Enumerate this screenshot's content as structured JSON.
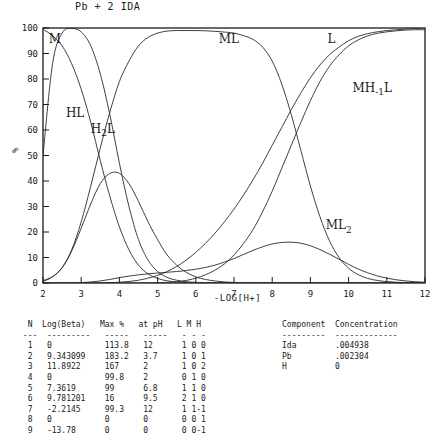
{
  "title": "Pb + 2 IDA",
  "chart_data": {
    "type": "line",
    "title": "Pb + 2 IDA",
    "xlabel": "-LOG[H+]",
    "ylabel": "%",
    "xlim": [
      2,
      12
    ],
    "ylim": [
      0,
      100
    ],
    "xticks": [
      2,
      3,
      4,
      5,
      6,
      7,
      8,
      9,
      10,
      11,
      12
    ],
    "yticks": [
      0,
      10,
      20,
      30,
      40,
      50,
      60,
      70,
      80,
      90,
      100
    ],
    "grid": false,
    "legend": "inline-curve-labels",
    "x": [
      2,
      2.25,
      2.5,
      2.75,
      3,
      3.25,
      3.5,
      3.75,
      4,
      4.25,
      4.5,
      4.75,
      5,
      5.25,
      5.5,
      5.75,
      6,
      6.25,
      6.5,
      6.75,
      7,
      7.25,
      7.5,
      7.75,
      8,
      8.25,
      8.5,
      8.75,
      9,
      9.25,
      9.5,
      9.75,
      10,
      10.25,
      10.5,
      10.75,
      11,
      11.25,
      11.5,
      11.75,
      12
    ],
    "series": [
      {
        "name": "M",
        "label": "M",
        "values": [
          50,
          86,
          98,
          99.8,
          98.5,
          93,
          82,
          66,
          47,
          30,
          17,
          9,
          4.5,
          2.2,
          1.1,
          0.5,
          0.25,
          0.12,
          0.06,
          0.03,
          0.01,
          0,
          0,
          0,
          0,
          0,
          0,
          0,
          0,
          0,
          0,
          0,
          0,
          0,
          0,
          0,
          0,
          0,
          0,
          0,
          0
        ]
      },
      {
        "name": "H2L",
        "label": "H2L",
        "values": [
          99.5,
          97,
          93,
          86,
          76,
          63,
          48,
          34,
          22,
          13,
          7,
          3.6,
          1.8,
          0.85,
          0.4,
          0.18,
          0.08,
          0.035,
          0.015,
          0.006,
          0.002,
          0,
          0,
          0,
          0,
          0,
          0,
          0,
          0,
          0,
          0,
          0,
          0,
          0,
          0,
          0,
          0,
          0,
          0,
          0,
          0
        ]
      },
      {
        "name": "HL",
        "label": "HL",
        "values": [
          0.6,
          2.4,
          6,
          12.5,
          21.5,
          31,
          39,
          43,
          43,
          39,
          32,
          24,
          17,
          11,
          7,
          4.2,
          2.4,
          1.4,
          0.8,
          0.42,
          0.22,
          0.11,
          0.06,
          0.03,
          0.015,
          0.007,
          0.003,
          0.001,
          0,
          0,
          0,
          0,
          0,
          0,
          0,
          0,
          0,
          0,
          0,
          0,
          0
        ]
      },
      {
        "name": "ML",
        "label": "ML",
        "values": [
          0.9,
          2.5,
          6,
          13,
          24,
          38,
          53,
          67,
          79,
          87,
          93,
          96.3,
          98,
          98.8,
          99,
          99,
          99,
          98.9,
          98.7,
          98.4,
          98,
          97,
          95.5,
          92.5,
          87,
          78,
          66,
          52,
          38,
          26,
          16.5,
          10,
          5.8,
          3.3,
          1.8,
          1,
          0.55,
          0.3,
          0.16,
          0.08,
          0.04
        ]
      },
      {
        "name": "ML2",
        "label": "ML2",
        "values": [
          0,
          0,
          0,
          0.05,
          0.15,
          0.4,
          0.8,
          1.4,
          2.1,
          2.7,
          3.2,
          3.6,
          3.9,
          4.2,
          4.5,
          4.9,
          5.4,
          6.1,
          7,
          8.2,
          9.6,
          11.2,
          12.8,
          14.2,
          15.3,
          15.9,
          16,
          15.6,
          14.6,
          13.1,
          11.3,
          9.3,
          7.3,
          5.5,
          4,
          2.8,
          1.9,
          1.25,
          0.8,
          0.5,
          0.3
        ]
      },
      {
        "name": "MH-1L",
        "label": "MH-1L",
        "values": [
          0,
          0,
          0,
          0,
          0,
          0,
          0,
          0,
          0,
          0,
          0.02,
          0.05,
          0.12,
          0.25,
          0.5,
          1,
          1.9,
          3.2,
          5,
          7.5,
          11,
          15.5,
          21,
          28,
          36,
          45,
          54,
          63,
          71.5,
          79,
          85,
          89.5,
          93,
          95.3,
          96.9,
          97.9,
          98.5,
          98.9,
          99.2,
          99.3,
          99.3
        ]
      },
      {
        "name": "L",
        "label": "L",
        "values": [
          0,
          0,
          0,
          0,
          0,
          0,
          0.05,
          0.12,
          0.3,
          0.6,
          1.1,
          1.9,
          3,
          4.5,
          6.5,
          9,
          12,
          15.5,
          19.5,
          24,
          29,
          34.5,
          40.5,
          47,
          54,
          61,
          68,
          74.5,
          80.5,
          85.5,
          89.5,
          92.5,
          95,
          96.7,
          97.8,
          98.5,
          99,
          99.3,
          99.6,
          99.8,
          100
        ]
      }
    ],
    "curve_labels": [
      {
        "text": "M",
        "x": 2.15,
        "y": 94
      },
      {
        "text": "HL",
        "x": 2.6,
        "y": 65
      },
      {
        "text": "H2L",
        "x": 3.25,
        "y": 59
      },
      {
        "text": "ML",
        "x": 6.6,
        "y": 94
      },
      {
        "text": "L",
        "x": 9.45,
        "y": 94
      },
      {
        "text": "MH-1L",
        "x": 10.1,
        "y": 75
      },
      {
        "text": "ML2",
        "x": 9.4,
        "y": 21
      }
    ]
  },
  "species_table": {
    "headers": [
      "N",
      "Log(Beta)",
      "Max %",
      "at pH",
      "L",
      "M",
      "H"
    ],
    "text": "  N  Log(Beta)   Max %   at pH   L M H\n ---  ---------   -----   -----   - - -\n  1   0           113.8   12      1 0 0\n  2   9.343099    183.2   3.7     1 0 1\n  3   11.8922     167     2       1 0 2\n  4   0           99.8    2       0 1 0\n  5   7.3619      99      6.8     1 1 0\n  6   9.781201    16      9.5     2 1 0\n  7   -2.2145     99.3    12      1 1-1\n  8   0           0       0       0 0 1\n  9   -13.78      0       0       0 0-1",
    "rows": [
      {
        "n": "1",
        "log_beta": "0",
        "max_pct": "113.8",
        "at_ph": "12",
        "L": "1",
        "M": "0",
        "H": "0"
      },
      {
        "n": "2",
        "log_beta": "9.343099",
        "max_pct": "183.2",
        "at_ph": "3.7",
        "L": "1",
        "M": "0",
        "H": "1"
      },
      {
        "n": "3",
        "log_beta": "11.8922",
        "max_pct": "167",
        "at_ph": "2",
        "L": "1",
        "M": "0",
        "H": "2"
      },
      {
        "n": "4",
        "log_beta": "0",
        "max_pct": "99.8",
        "at_ph": "2",
        "L": "0",
        "M": "1",
        "H": "0"
      },
      {
        "n": "5",
        "log_beta": "7.3619",
        "max_pct": "99",
        "at_ph": "6.8",
        "L": "1",
        "M": "1",
        "H": "0"
      },
      {
        "n": "6",
        "log_beta": "9.781201",
        "max_pct": "16",
        "at_ph": "9.5",
        "L": "2",
        "M": "1",
        "H": "0"
      },
      {
        "n": "7",
        "log_beta": "-2.2145",
        "max_pct": "99.3",
        "at_ph": "12",
        "L": "1",
        "M": "1",
        "H": "-1"
      },
      {
        "n": "8",
        "log_beta": "0",
        "max_pct": "0",
        "at_ph": "0",
        "L": "0",
        "M": "0",
        "H": "1"
      },
      {
        "n": "9",
        "log_beta": "-13.78",
        "max_pct": "0",
        "at_ph": "0",
        "L": "0",
        "M": "0",
        "H": "-1"
      }
    ]
  },
  "component_table": {
    "headers": [
      "Component",
      "Concentration"
    ],
    "text": "Component  Concentration\n---------  -------------\nIda        .004938\nPb         .002304\nH          0",
    "rows": [
      {
        "component": "Ida",
        "concentration": ".004938"
      },
      {
        "component": "Pb",
        "concentration": ".002304"
      },
      {
        "component": "H",
        "concentration": "0"
      }
    ]
  }
}
